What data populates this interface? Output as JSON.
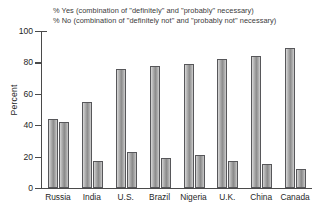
{
  "chart_data": {
    "type": "bar",
    "title": "",
    "subtitle": "",
    "xlabel": "",
    "ylabel": "Percent",
    "ylim": [
      0,
      100
    ],
    "yticks": [
      0,
      20,
      40,
      60,
      80,
      100
    ],
    "ytick_labels": [
      "0",
      "20",
      "40",
      "60",
      "80",
      "100"
    ],
    "grid": false,
    "legend_position": "top",
    "categories": [
      "Russia",
      "India",
      "U.S.",
      "Brazil",
      "Nigeria",
      "U.K.",
      "China",
      "Canada"
    ],
    "series": [
      {
        "name": "% Yes (combination of \"definitely\" and \"probably\" necessary)",
        "short_name": "% Yes",
        "values": [
          44,
          55,
          76,
          78,
          79,
          82,
          84,
          89
        ]
      },
      {
        "name": "% No (combination of \"definitely not\" and \"probably not\" necessary)",
        "short_name": "% No",
        "values": [
          42,
          17,
          23,
          19,
          21,
          17,
          15,
          12
        ]
      }
    ],
    "annotations": []
  },
  "legend": {
    "line1": "% Yes (combination of \"definitely\" and \"probably\" necessary)",
    "line2": "% No (combination of \"definitely not\" and \"probably not\" necessary)"
  },
  "axes": {
    "y_title": "Percent"
  },
  "colors": {
    "background": "#ffffff",
    "axis": "#4a4a4a",
    "text": "#1f1f1f",
    "bar_yes": "#8d8d8d",
    "bar_no": "#8a8a8a"
  }
}
